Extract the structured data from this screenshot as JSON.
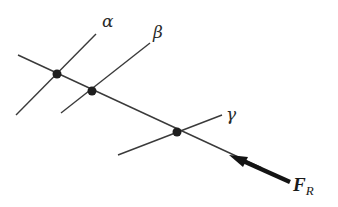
{
  "diagram": {
    "colors": {
      "line": "#3a3a3a",
      "dot": "#1e1e1e",
      "arrow": "#141414",
      "background": "#ffffff"
    },
    "main_line": {
      "x1": 18,
      "y1": 55,
      "x2": 262,
      "y2": 168
    },
    "axes": [
      {
        "id": "alpha",
        "label": "α",
        "x1": 16,
        "y1": 115,
        "x2": 96,
        "y2": 34,
        "dot": [
          57,
          74
        ],
        "label_pos": [
          102,
          27
        ]
      },
      {
        "id": "beta",
        "label": "β",
        "x1": 61,
        "y1": 113,
        "x2": 150,
        "y2": 43,
        "dot": [
          92,
          91
        ],
        "label_pos": [
          153,
          38
        ]
      },
      {
        "id": "gamma",
        "label": "γ",
        "x1": 118,
        "y1": 155,
        "x2": 222,
        "y2": 115,
        "dot": [
          177,
          132
        ],
        "label_pos": [
          226,
          118
        ]
      }
    ],
    "force": {
      "label_main": "F",
      "label_sub": "R",
      "tail": [
        290,
        182
      ],
      "tip": [
        230,
        155
      ],
      "label_pos": [
        295,
        189
      ]
    }
  }
}
